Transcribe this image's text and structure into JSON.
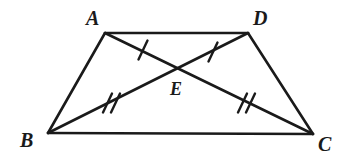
{
  "figure": {
    "type": "geometry-diagram",
    "shape": "trapezoid-with-diagonals",
    "background_color": "#ffffff",
    "stroke_color": "#1a1a1a",
    "width": 350,
    "height": 162,
    "labels": {
      "a": "A",
      "b": "B",
      "c": "C",
      "d": "D",
      "e": "E"
    },
    "vertices": [
      {
        "name": "A",
        "x": 105,
        "y": 33
      },
      {
        "name": "D",
        "x": 248,
        "y": 33
      },
      {
        "name": "B",
        "x": 48,
        "y": 133
      },
      {
        "name": "C",
        "x": 313,
        "y": 134
      },
      {
        "name": "E",
        "x": 180,
        "y": 68
      }
    ],
    "segments": [
      {
        "name": "AD",
        "from": "A",
        "to": "D",
        "kind": "side"
      },
      {
        "name": "AB",
        "from": "A",
        "to": "B",
        "kind": "side"
      },
      {
        "name": "DC",
        "from": "D",
        "to": "C",
        "kind": "side"
      },
      {
        "name": "BC",
        "from": "B",
        "to": "C",
        "kind": "side"
      },
      {
        "name": "AC",
        "from": "A",
        "to": "C",
        "kind": "diagonal"
      },
      {
        "name": "DB",
        "from": "D",
        "to": "B",
        "kind": "diagonal"
      }
    ],
    "congruence_marks": [
      {
        "segment": "AE",
        "ticks": 1,
        "x": 143,
        "y": 50
      },
      {
        "segment": "DE",
        "ticks": 1,
        "x": 213,
        "y": 52
      },
      {
        "segment": "BE",
        "ticks": 2,
        "x": 110,
        "y": 103
      },
      {
        "segment": "EC",
        "ticks": 2,
        "x": 245,
        "y": 103
      }
    ]
  }
}
